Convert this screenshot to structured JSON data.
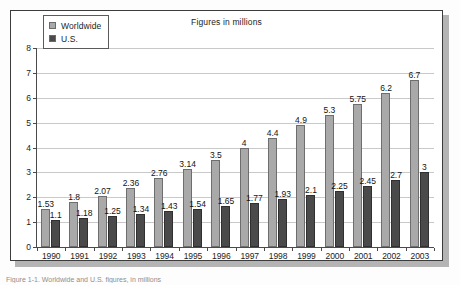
{
  "figure": {
    "title": "Figures in millions",
    "caption": "Figure 1-1. Worldwide and U.S. figures, in millions"
  },
  "legend": {
    "position": "top-left",
    "entries": [
      {
        "label": "Worldwide",
        "color": "#a9a9a9",
        "swatch": "worldwide-swatch"
      },
      {
        "label": "U.S.",
        "color": "#4a4a4a",
        "swatch": "us-swatch"
      }
    ]
  },
  "axes": {
    "y_ticks": [
      "8",
      "7",
      "6",
      "5",
      "4",
      "3",
      "2",
      "1",
      "0"
    ],
    "x_ticks": [
      "1990",
      "1991",
      "1992",
      "1993",
      "1994",
      "1995",
      "1996",
      "1997",
      "1998",
      "1999",
      "2000",
      "2001",
      "2002",
      "2003"
    ]
  },
  "chart_data": {
    "type": "bar",
    "title": "Figures in millions",
    "xlabel": "",
    "ylabel": "",
    "ylim": [
      0,
      8
    ],
    "grid": true,
    "legend_position": "top-left",
    "categories": [
      "1990",
      "1991",
      "1992",
      "1993",
      "1994",
      "1995",
      "1996",
      "1997",
      "1998",
      "1999",
      "2000",
      "2001",
      "2002",
      "2003"
    ],
    "series": [
      {
        "name": "Worldwide",
        "color": "#a9a9a9",
        "values": [
          1.53,
          1.8,
          2.07,
          2.36,
          2.76,
          3.14,
          3.5,
          4,
          4.4,
          4.9,
          5.3,
          5.75,
          6.2,
          6.7
        ],
        "labels": [
          "1.53",
          "1.8",
          "2.07",
          "2.36",
          "2.76",
          "3.14",
          "3.5",
          "4",
          "4.4",
          "4.9",
          "5.3",
          "5.75",
          "6.2",
          "6.7"
        ]
      },
      {
        "name": "U.S.",
        "color": "#4a4a4a",
        "values": [
          1.1,
          1.18,
          1.25,
          1.34,
          1.43,
          1.54,
          1.65,
          1.77,
          1.93,
          2.1,
          2.25,
          2.45,
          2.7,
          3
        ],
        "labels": [
          "1.1",
          "1.18",
          "1.25",
          "1.34",
          "1.43",
          "1.54",
          "1.65",
          "1.77",
          "1.93",
          "2.1",
          "2.25",
          "2.45",
          "2.7",
          "3"
        ]
      }
    ]
  }
}
